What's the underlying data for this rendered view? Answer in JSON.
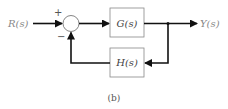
{
  "diagram": {
    "type": "feedback-block-diagram",
    "input": {
      "label": "R(s)"
    },
    "output": {
      "label": "Y(s)"
    },
    "summing_junction": {
      "plus_sign": "+",
      "minus_sign": "−"
    },
    "forward_block": {
      "label": "G(s)"
    },
    "feedback_block": {
      "label": "H(s)"
    },
    "caption": "(b)",
    "colors": {
      "line": "#111111",
      "box_border": "#888888",
      "label": "#888888"
    }
  }
}
